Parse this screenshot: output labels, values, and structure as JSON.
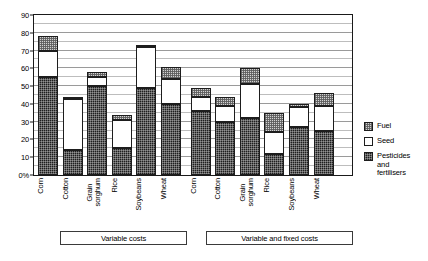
{
  "chart_data": {
    "type": "bar",
    "title": "",
    "xlabel": "",
    "ylabel": "",
    "ylim": [
      0,
      90
    ],
    "ytick_labels": [
      "0%",
      "10",
      "20",
      "30",
      "40",
      "50",
      "60",
      "70",
      "80",
      "90"
    ],
    "ytick_values": [
      0,
      10,
      20,
      30,
      40,
      50,
      60,
      70,
      80,
      90
    ],
    "grid": true,
    "stacked": true,
    "legend_position": "right",
    "legend": [
      "Fuel",
      "Seed",
      "Pesticides and fertilisers"
    ],
    "groups": [
      {
        "label": "Variable costs",
        "categories": [
          "Corn",
          "Cotton",
          "Grain sorghum",
          "Rice",
          "Soybeans",
          "Wheat"
        ],
        "series": [
          {
            "name": "Pesticides and fertilisers",
            "values": [
              55,
              14,
              50,
              15,
              49,
              40
            ]
          },
          {
            "name": "Seed",
            "values": [
              15,
              29,
              5,
              16,
              23,
              14
            ]
          },
          {
            "name": "Fuel",
            "values": [
              8,
              1,
              3,
              3,
              1,
              7
            ]
          }
        ],
        "totals": [
          78,
          44,
          58,
          34,
          73,
          61
        ]
      },
      {
        "label": "Variable and fixed costs",
        "categories": [
          "Corn",
          "Cotton",
          "Grain sorghum",
          "Rice",
          "Soybeans",
          "Wheat"
        ],
        "series": [
          {
            "name": "Pesticides and fertilisers",
            "values": [
              36,
              30,
              32,
              12,
              27,
              25
            ]
          },
          {
            "name": "Seed",
            "values": [
              8,
              9,
              19,
              12,
              11,
              14
            ]
          },
          {
            "name": "Fuel",
            "values": [
              5,
              5,
              9,
              11,
              2,
              7
            ]
          }
        ],
        "totals": [
          49,
          44,
          60,
          35,
          40,
          46
        ]
      }
    ]
  },
  "axis": {
    "ticks": [
      {
        "label": "90",
        "value": 90
      },
      {
        "label": "80",
        "value": 80
      },
      {
        "label": "70",
        "value": 70
      },
      {
        "label": "60",
        "value": 60
      },
      {
        "label": "50",
        "value": 50
      },
      {
        "label": "40",
        "value": 40
      },
      {
        "label": "30",
        "value": 30
      },
      {
        "label": "20",
        "value": 20
      },
      {
        "label": "10",
        "value": 10
      },
      {
        "label": "0%",
        "value": 0
      }
    ]
  },
  "x_labels": [
    "Corn",
    "Cotton",
    "Grain\nsorghum",
    "Rice",
    "Soybeans",
    "Wheat",
    "Corn",
    "Cotton",
    "Grain\nsorghum",
    "Rice",
    "Soybeans",
    "Wheat"
  ],
  "groups": {
    "variable": "Variable costs",
    "variable_fixed": "Variable and fixed costs"
  },
  "legend": {
    "items": [
      {
        "key": "fuel",
        "label": "Fuel",
        "color": "#d2d2d2"
      },
      {
        "key": "seed",
        "label": "Seed",
        "color": "#ffffff"
      },
      {
        "key": "pest",
        "label": "Pesticides\nand\nfertilisers",
        "color": "#1f1f1f"
      }
    ]
  }
}
